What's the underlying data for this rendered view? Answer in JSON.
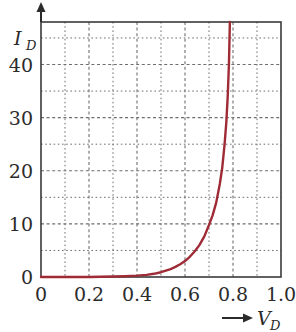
{
  "chart_data": {
    "type": "line",
    "title": "",
    "subtitle": "",
    "xlabel": "V_D",
    "ylabel": "I_D",
    "xlabel_display": "V",
    "xlabel_sub": "D",
    "ylabel_display": "I",
    "ylabel_sub": "D",
    "xlim": [
      0,
      1.0
    ],
    "ylim": [
      0,
      48
    ],
    "grid": true,
    "grid_style": "dotted",
    "legend": "none",
    "x_ticks": [
      0,
      0.2,
      0.4,
      0.6,
      0.8,
      1.0
    ],
    "x_tick_labels": [
      "0",
      "0.2",
      "0.4",
      "0.6",
      "0.8",
      "1.0"
    ],
    "x_minor_step": 0.1,
    "y_ticks": [
      0,
      10,
      20,
      30,
      40
    ],
    "y_tick_labels": [
      "0",
      "10",
      "20",
      "30",
      "40"
    ],
    "y_minor_step": 5,
    "series": [
      {
        "name": "diode-iv-curve",
        "color": "#9e2b35",
        "x": [
          0.0,
          0.05,
          0.1,
          0.15,
          0.2,
          0.25,
          0.3,
          0.35,
          0.4,
          0.44,
          0.47,
          0.5,
          0.52,
          0.54,
          0.56,
          0.58,
          0.6,
          0.62,
          0.64,
          0.66,
          0.68,
          0.7,
          0.715,
          0.73,
          0.745,
          0.755,
          0.765,
          0.772,
          0.778,
          0.783,
          0.787
        ],
        "y": [
          0.0,
          0.0,
          0.0,
          0.0,
          0.0,
          0.05,
          0.1,
          0.15,
          0.25,
          0.4,
          0.6,
          0.9,
          1.2,
          1.5,
          1.9,
          2.4,
          3.0,
          3.8,
          4.8,
          6.0,
          7.6,
          9.8,
          11.6,
          14.0,
          17.5,
          20.5,
          25.0,
          29.0,
          34.0,
          40.0,
          48.0
        ]
      }
    ]
  },
  "axis_arrows": {
    "y_arrow": "up-arrow",
    "x_arrow": "right-arrow"
  },
  "colors": {
    "curve": "#9e2b35",
    "frame": "#3a3a3a",
    "grid": "#6e6e6e",
    "text": "#2b2b2b",
    "background": "#ffffff"
  }
}
